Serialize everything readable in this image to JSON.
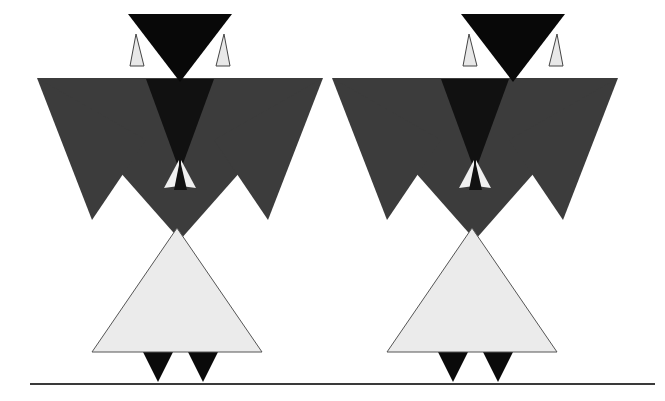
{
  "canvas": {
    "width": 665,
    "height": 401,
    "background": "#ffffff",
    "title": "Two symmetric triangular figures above a ground line"
  },
  "palette": {
    "background": "#ffffff",
    "head_fill": "#080808",
    "torso_fill": "#3c3c3c",
    "torso_inner_fill": "#111111",
    "arm_fill": "#3c3c3c",
    "skirt_fill": "#ebebeb",
    "skirt_stroke": "#555555",
    "ear_fill": "#e8e8e8",
    "ear_stroke": "#444444",
    "chest_light_fill": "#f0f0f0",
    "chest_dark_fill": "#111111",
    "foot_fill": "#0a0a0a",
    "ground_line": "#3a3a3a"
  },
  "ground": {
    "label": "ground-line",
    "x1": 30,
    "y1": 384,
    "x2": 655,
    "y2": 384,
    "thickness": 2.2
  },
  "figures": [
    {
      "id": "figure-left",
      "label": "Left triangular figure",
      "offset_x": 0,
      "parts": {
        "head": {
          "label": "head",
          "shape": "downward-triangle",
          "points": "128,14 232,14 180,82",
          "fill": "#080808"
        },
        "ear_left": {
          "label": "left-ear",
          "shape": "narrow-upward-triangle",
          "points": "136,34 130,66 144,66",
          "fill": "#e8e8e8",
          "stroke": "#444444"
        },
        "ear_right": {
          "label": "right-ear",
          "shape": "narrow-upward-triangle",
          "points": "224,34 216,66 230,66",
          "fill": "#e8e8e8",
          "stroke": "#444444"
        },
        "torso": {
          "label": "torso-shoulders",
          "shape": "downward-triangle",
          "points": "37,78 323,78 180,240",
          "fill": "#3c3c3c"
        },
        "torso_inner": {
          "label": "torso-inner-shadow",
          "shape": "downward-triangle",
          "points": "146,79 214,79 180,172",
          "fill": "#111111"
        },
        "arm_left": {
          "label": "left-arm",
          "shape": "downward-triangle",
          "points": "37,78 146,140 92,220",
          "fill": "#3c3c3c"
        },
        "arm_right": {
          "label": "right-arm",
          "shape": "downward-triangle",
          "points": "323,78 214,140 268,220",
          "fill": "#3c3c3c"
        },
        "chest_fan_left": {
          "label": "chest-fan-left",
          "shape": "small-triangle",
          "points": "179,160 164,188 179,186",
          "fill": "#f0f0f0"
        },
        "chest_fan_center": {
          "label": "chest-fan-center",
          "shape": "small-triangle",
          "points": "180,160 174,190 187,190",
          "fill": "#111111"
        },
        "chest_fan_right": {
          "label": "chest-fan-right",
          "shape": "small-triangle",
          "points": "181,160 196,188 181,186",
          "fill": "#f0f0f0"
        },
        "skirt": {
          "label": "skirt",
          "shape": "upward-triangle",
          "points": "177,228 262,352 92,352",
          "fill": "#ebebeb",
          "stroke": "#555555"
        },
        "foot_left": {
          "label": "left-foot",
          "shape": "downward-triangle",
          "points": "143,352 173,352 158,382",
          "fill": "#0a0a0a"
        },
        "foot_right": {
          "label": "right-foot",
          "shape": "downward-triangle",
          "points": "188,352 218,352 203,382",
          "fill": "#0a0a0a"
        }
      }
    },
    {
      "id": "figure-right",
      "label": "Right triangular figure",
      "offset_x": 333,
      "parts": {
        "head": {
          "label": "head",
          "shape": "downward-triangle",
          "points": "128,14 232,14 180,82",
          "fill": "#080808"
        },
        "ear_left": {
          "label": "left-ear",
          "shape": "narrow-upward-triangle",
          "points": "136,34 130,66 144,66",
          "fill": "#e8e8e8",
          "stroke": "#444444"
        },
        "ear_right": {
          "label": "right-ear",
          "shape": "narrow-upward-triangle",
          "points": "224,34 216,66 230,66",
          "fill": "#e8e8e8",
          "stroke": "#444444"
        },
        "torso": {
          "label": "torso-shoulders",
          "shape": "downward-triangle",
          "points": "-1,78 285,78 142,240",
          "fill": "#3c3c3c"
        },
        "torso_inner": {
          "label": "torso-inner-shadow",
          "shape": "downward-triangle",
          "points": "108,79 176,79 142,172",
          "fill": "#111111"
        },
        "arm_left": {
          "label": "left-arm",
          "shape": "downward-triangle",
          "points": "-1,78 108,140 54,220",
          "fill": "#3c3c3c"
        },
        "arm_right": {
          "label": "right-arm",
          "shape": "downward-triangle",
          "points": "285,78 176,140 230,220",
          "fill": "#3c3c3c"
        },
        "chest_fan_left": {
          "label": "chest-fan-left",
          "shape": "small-triangle",
          "points": "141,160 126,188 141,186",
          "fill": "#f0f0f0"
        },
        "chest_fan_center": {
          "label": "chest-fan-center",
          "shape": "small-triangle",
          "points": "142,160 136,190 149,190",
          "fill": "#111111"
        },
        "chest_fan_right": {
          "label": "chest-fan-right",
          "shape": "small-triangle",
          "points": "143,160 158,188 143,186",
          "fill": "#f0f0f0"
        },
        "skirt": {
          "label": "skirt",
          "shape": "upward-triangle",
          "points": "139,228 224,352 54,352",
          "fill": "#ebebeb",
          "stroke": "#555555"
        },
        "foot_left": {
          "label": "left-foot",
          "shape": "downward-triangle",
          "points": "105,352 135,352 120,382",
          "fill": "#0a0a0a"
        },
        "foot_right": {
          "label": "right-foot",
          "shape": "downward-triangle",
          "points": "150,352 180,352 165,382",
          "fill": "#0a0a0a"
        }
      }
    }
  ]
}
